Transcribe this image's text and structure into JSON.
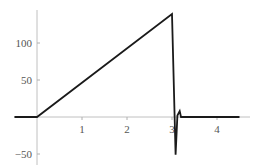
{
  "chart_data": {
    "type": "line",
    "title": "",
    "xlabel": "",
    "ylabel": "",
    "xlim": [
      -0.5,
      4.55
    ],
    "ylim": [
      -55,
      140
    ],
    "grid": false,
    "legend": null,
    "x_ticks": [
      1,
      2,
      3,
      4
    ],
    "x_tick_labels": [
      "1",
      "2",
      "3",
      "4"
    ],
    "y_ticks": [
      -50,
      50,
      100
    ],
    "y_tick_labels": [
      "−50",
      "50",
      "100"
    ],
    "series": [
      {
        "name": "signal",
        "color": "#1a1a1a",
        "x": [
          -0.5,
          0.0,
          3.0,
          3.08,
          3.12,
          3.17,
          3.2,
          4.5
        ],
        "y": [
          0,
          0,
          139,
          -51,
          2,
          8,
          0,
          0
        ]
      }
    ]
  },
  "colors": {
    "axis": "#b0b0b0",
    "line": "#1a1a1a",
    "tick_text": "#555555"
  }
}
